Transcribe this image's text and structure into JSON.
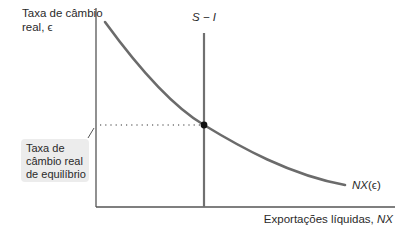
{
  "diagram": {
    "y_axis_label": "Taxa de câmbio real, ϵ",
    "y_axis_label_line1": "Taxa de câmbio",
    "y_axis_label_line2": "real, ϵ",
    "x_axis_label": "Exportações líquidas, NX",
    "x_axis_label_text": "Exportações líquidas, ",
    "x_axis_label_var": "NX",
    "vertical_line_label": "S − I",
    "curve_label": "NX(ϵ)",
    "curve_label_var": "NX",
    "curve_label_arg": "(ϵ)",
    "equilibrium_label": "Taxa de câmbio real de equilíbrio",
    "equilibrium_label_lines": [
      "Taxa de",
      "câmbio real",
      "de equilíbrio"
    ],
    "colors": {
      "axes": "#555555",
      "curve": "#6b6b6b",
      "vertical_line": "#707070",
      "equilibrium_point": "#111111",
      "label_box": "#ececec",
      "text": "#2a2a2a"
    }
  }
}
